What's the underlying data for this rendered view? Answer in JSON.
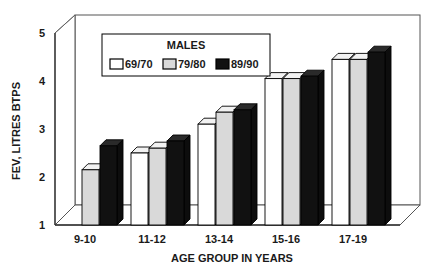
{
  "chart_data": {
    "type": "bar",
    "title": "",
    "legend_title": "MALES",
    "legend_position": "top-left-inside",
    "xlabel": "AGE GROUP IN YEARS",
    "ylabel": "FEV, LITRES BTPS",
    "ylim": [
      1,
      5
    ],
    "yticks": [
      "1",
      "2",
      "3",
      "4",
      "5"
    ],
    "grid": false,
    "style": "3d-grouped-bars",
    "categories": [
      "9-10",
      "11-12",
      "13-14",
      "15-16",
      "17-19"
    ],
    "series": [
      {
        "name": "69/70",
        "color": "#ffffff",
        "values": [
          null,
          2.5,
          3.1,
          4.05,
          4.45
        ]
      },
      {
        "name": "79/80",
        "color": "#d9d9d9",
        "values": [
          2.15,
          2.6,
          3.35,
          4.05,
          4.45
        ]
      },
      {
        "name": "89/90",
        "color": "#111111",
        "values": [
          2.65,
          2.75,
          3.4,
          4.1,
          4.6
        ]
      }
    ]
  },
  "axes": {
    "ylabel": "FEV, LITRES BTPS",
    "xlabel": "AGE GROUP IN YEARS",
    "yticks": [
      {
        "label": "5",
        "value": 5
      },
      {
        "label": "4",
        "value": 4
      },
      {
        "label": "3",
        "value": 3
      },
      {
        "label": "2",
        "value": 2
      },
      {
        "label": "1",
        "value": 1
      }
    ],
    "xticks": [
      {
        "label": "9-10"
      },
      {
        "label": "11-12"
      },
      {
        "label": "13-14"
      },
      {
        "label": "15-16"
      },
      {
        "label": "17-19"
      }
    ]
  },
  "legend": {
    "title": "MALES",
    "entries": [
      {
        "label": "69/70",
        "swatch": "white"
      },
      {
        "label": "79/80",
        "swatch": "light-gray"
      },
      {
        "label": "89/90",
        "swatch": "black"
      }
    ]
  },
  "colors": {
    "series_1": "#ffffff",
    "series_2": "#d9d9d9",
    "series_3": "#111111",
    "outline": "#000000",
    "background": "#ffffff"
  }
}
